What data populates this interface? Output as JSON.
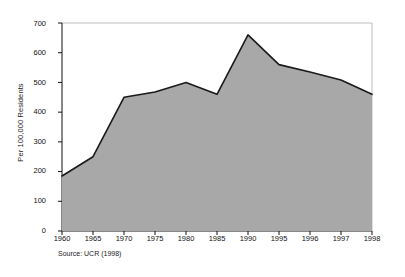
{
  "chart_data": {
    "type": "area",
    "title": "",
    "subtitle": "",
    "xlabel": "",
    "ylabel": "Per 100,000 Residents",
    "categories": [
      "1960",
      "1965",
      "1970",
      "1975",
      "1980",
      "1985",
      "1990",
      "1995",
      "1996",
      "1997",
      "1998"
    ],
    "x": [
      1960,
      1965,
      1970,
      1975,
      1980,
      1985,
      1990,
      1995,
      1996,
      1997,
      1998
    ],
    "values": [
      185,
      250,
      450,
      468,
      500,
      460,
      660,
      560,
      535,
      508,
      460
    ],
    "series": [
      {
        "name": "Violent crime rate",
        "values": [
          185,
          250,
          450,
          468,
          500,
          460,
          660,
          560,
          535,
          508,
          460
        ]
      }
    ],
    "ylim": [
      0,
      700
    ],
    "yticks": [
      0,
      100,
      200,
      300,
      400,
      500,
      600,
      700
    ],
    "ytick_labels": [
      "0",
      "100",
      "200",
      "300",
      "400",
      "500",
      "600",
      "700"
    ],
    "xtick_labels": [
      "1960",
      "1965",
      "1970",
      "1975",
      "1980",
      "1985",
      "1990",
      "1995",
      "1996",
      "1997",
      "1998"
    ],
    "grid": false,
    "legend": "none",
    "annotations": [
      "Source: UCR (1998)"
    ],
    "colors": {
      "fill": "#a8a8a8",
      "line": "#1a1a1a",
      "axis": "#111111",
      "frame": "#bdbdbd",
      "text": "#111111",
      "background": "#ffffff"
    }
  },
  "axes": {
    "y_title": "Per 100,000 Residents"
  },
  "footer": {
    "source": "Source: UCR (1998)"
  }
}
